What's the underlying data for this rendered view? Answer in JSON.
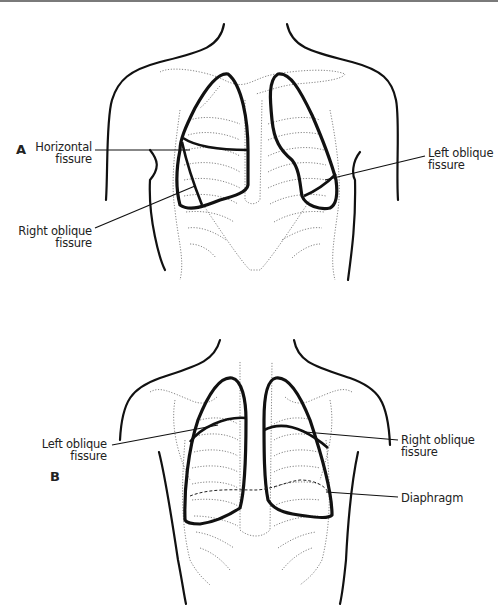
{
  "figure_a": {
    "panel_label": "A",
    "labels": {
      "horizontal_fissure": [
        "Horizontal",
        "fissure"
      ],
      "right_oblique_fissure": [
        "Right oblique",
        "fissure"
      ],
      "left_oblique_fissure": [
        "Left oblique",
        "fissure"
      ]
    },
    "view": "anterior"
  },
  "figure_b": {
    "panel_label": "B",
    "labels": {
      "left_oblique_fissure": [
        "Left oblique",
        "fissure"
      ],
      "right_oblique_fissure": [
        "Right oblique",
        "fissure"
      ],
      "diaphragm": "Diaphragm"
    },
    "view": "posterior"
  },
  "colors": {
    "outline": "#111111",
    "skeleton": "#777777",
    "background": "#ffffff"
  }
}
